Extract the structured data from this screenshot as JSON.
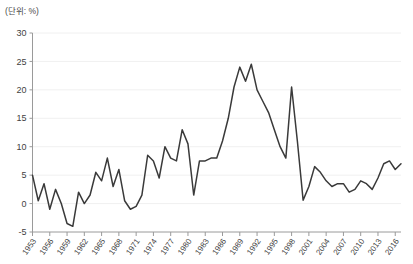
{
  "unit_note": "(단위: %)",
  "chart_data": {
    "type": "line",
    "title": "",
    "subtitle": "",
    "xlabel": "",
    "ylabel": "",
    "unit_label": "(단위: %)",
    "ylim": [
      -5,
      30
    ],
    "ytick_values": [
      -5,
      0,
      5,
      10,
      15,
      20,
      25,
      30
    ],
    "ytick_labels": [
      "-5",
      "0",
      "5",
      "10",
      "15",
      "20",
      "25",
      "30"
    ],
    "grid": true,
    "grid_axis": "y",
    "legend": false,
    "legend_position": "none",
    "line_color": "#3a3a3a",
    "xtick_labels": [
      "1953",
      "1956",
      "1959",
      "1962",
      "1965",
      "1968",
      "1971",
      "1974",
      "1977",
      "1980",
      "1983",
      "1986",
      "1989",
      "1992",
      "1995",
      "1998",
      "2001",
      "2004",
      "2007",
      "2010",
      "2013",
      "2016"
    ],
    "xtick_interval_years": 3,
    "x": [
      1953,
      1954,
      1955,
      1956,
      1957,
      1958,
      1959,
      1960,
      1961,
      1962,
      1963,
      1964,
      1965,
      1966,
      1967,
      1968,
      1969,
      1970,
      1971,
      1972,
      1973,
      1974,
      1975,
      1976,
      1977,
      1978,
      1979,
      1980,
      1981,
      1982,
      1983,
      1984,
      1985,
      1986,
      1987,
      1988,
      1989,
      1990,
      1991,
      1992,
      1993,
      1994,
      1995,
      1996,
      1997,
      1998,
      1999,
      2000,
      2001,
      2002,
      2003,
      2004,
      2005,
      2006,
      2007,
      2008,
      2009,
      2010,
      2011,
      2012,
      2013,
      2014,
      2015,
      2016,
      2017
    ],
    "values": [
      5.0,
      0.5,
      3.5,
      -1.0,
      2.5,
      0.0,
      -3.5,
      -4.0,
      2.0,
      0.0,
      1.5,
      5.5,
      4.0,
      8.0,
      3.0,
      6.0,
      0.5,
      -1.0,
      -0.5,
      1.5,
      8.5,
      7.5,
      4.5,
      10.0,
      8.0,
      7.5,
      13.0,
      10.5,
      1.5,
      7.5,
      7.5,
      8.0,
      8.0,
      11.0,
      15.0,
      20.5,
      24.0,
      21.5,
      24.5,
      20.0,
      18.0,
      16.0,
      13.0,
      10.0,
      8.0,
      20.5,
      11.0,
      0.6,
      3.0,
      6.5,
      5.5,
      4.0,
      3.0,
      3.5,
      3.5,
      2.0,
      2.5,
      4.0,
      3.5,
      2.5,
      4.5,
      7.0,
      7.5,
      6.0,
      7.0
    ],
    "series_name": "",
    "x_range": [
      1953,
      2017
    ]
  }
}
